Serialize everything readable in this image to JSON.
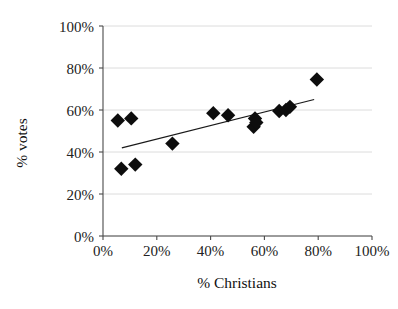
{
  "chart_data": {
    "type": "scatter",
    "title": "",
    "xlabel": "% Christians",
    "ylabel": "% votes",
    "xlim": [
      0,
      100
    ],
    "ylim": [
      0,
      100
    ],
    "grid": true,
    "legend": null,
    "x_tick_labels": [
      "0%",
      "20%",
      "40%",
      "60%",
      "80%",
      "100%"
    ],
    "y_tick_labels": [
      "0%",
      "20%",
      "40%",
      "60%",
      "80%",
      "100%"
    ],
    "x_ticks": [
      0,
      20,
      40,
      60,
      80,
      100
    ],
    "y_ticks": [
      0,
      20,
      40,
      60,
      80,
      100
    ],
    "marker_shape": "diamond",
    "marker_color": "#0d0d0d",
    "points": [
      {
        "x": 5.5,
        "y": 55.0
      },
      {
        "x": 10.5,
        "y": 56.0
      },
      {
        "x": 6.8,
        "y": 32.0
      },
      {
        "x": 12.0,
        "y": 34.0
      },
      {
        "x": 25.8,
        "y": 44.0
      },
      {
        "x": 41.0,
        "y": 58.5
      },
      {
        "x": 46.5,
        "y": 57.5
      },
      {
        "x": 56.5,
        "y": 56.0
      },
      {
        "x": 56.0,
        "y": 52.0
      },
      {
        "x": 57.0,
        "y": 54.0
      },
      {
        "x": 65.5,
        "y": 59.5
      },
      {
        "x": 68.0,
        "y": 60.0
      },
      {
        "x": 69.5,
        "y": 61.5
      },
      {
        "x": 79.5,
        "y": 74.5
      }
    ],
    "trendline": {
      "present": true,
      "x_start": 7.0,
      "y_start": 42.0,
      "x_end": 78.5,
      "y_end": 65.0,
      "color": "#1a1a1a"
    }
  }
}
